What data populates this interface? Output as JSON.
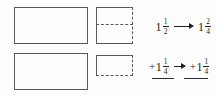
{
  "figure": {
    "background_color": "#fdfdfd",
    "line_color": "#555a5e",
    "text_color": "#1d1f21"
  },
  "area_models": [
    {
      "row": "top",
      "whole_label": "whole-unit-rectangle",
      "part_label": "one-half-square-split-into-fourths",
      "description": "One whole rectangle plus a square divided by a dashed line into two halves (2/4)"
    },
    {
      "row": "bottom",
      "whole_label": "whole-unit-rectangle",
      "part_label": "one-fourth-rectangle",
      "description": "One whole rectangle plus a small rectangle representing one fourth"
    }
  ],
  "equation": {
    "top_row": {
      "left_term": {
        "sign": "",
        "whole": "1",
        "numerator": "1",
        "denominator": "2"
      },
      "arrow": "⟶",
      "right_term": {
        "sign": "",
        "whole": "1",
        "numerator": "2",
        "denominator": "4"
      }
    },
    "bottom_row": {
      "left_term": {
        "sign": "+",
        "whole": "1",
        "numerator": "1",
        "denominator": "4"
      },
      "arrow": "→",
      "right_term": {
        "sign": "+",
        "whole": "1",
        "numerator": "1",
        "denominator": "4"
      }
    },
    "sum_lines": 2
  }
}
